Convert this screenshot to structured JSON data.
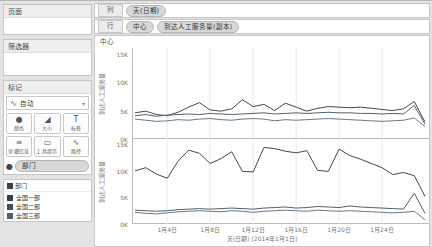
{
  "sidebar": {
    "pages": {
      "title": "页面"
    },
    "filters": {
      "title": "筛选器"
    },
    "marks": {
      "title": "标记",
      "type_icon": "∿",
      "type_label": "自动",
      "buttons": [
        {
          "name": "color",
          "icon": "●",
          "label": "颜色"
        },
        {
          "name": "size",
          "icon": "◢",
          "label": "大小"
        },
        {
          "name": "label",
          "icon": "T",
          "label": "标签"
        },
        {
          "name": "detail",
          "icon": "≡",
          "label": "详细信息"
        },
        {
          "name": "tooltip",
          "icon": "▭",
          "label": "工具提示"
        },
        {
          "name": "path",
          "icon": "∿",
          "label": "路径"
        }
      ],
      "color_shelf": {
        "icon": "●",
        "pill": "部门"
      }
    },
    "legend": {
      "title": "部门",
      "items": [
        {
          "label": "全国一部",
          "color": "#33404d"
        },
        {
          "label": "全国二部",
          "color": "#41505d"
        },
        {
          "label": "全国三部",
          "color": "#51606d"
        }
      ]
    }
  },
  "shelves": {
    "columns": {
      "label": "列",
      "pills": [
        "天(日期)"
      ]
    },
    "rows": {
      "label": "行",
      "pills": [
        "中心",
        "到达人工服务量(副本)"
      ]
    }
  },
  "chart_data": {
    "type": "line",
    "sheet_header": "中心",
    "x_caption": "天(日期) [2014年1月1日]",
    "days": 28,
    "x_ticks": [
      {
        "day": 4,
        "label": "1月4日"
      },
      {
        "day": 8,
        "label": "1月8日"
      },
      {
        "day": 12,
        "label": "1月12日"
      },
      {
        "day": 16,
        "label": "1月16日"
      },
      {
        "day": 20,
        "label": "1月20日"
      },
      {
        "day": 24,
        "label": "1月24日"
      }
    ],
    "ylim": [
      0,
      16
    ],
    "y_ticks": [
      {
        "v": 0,
        "label": "0K"
      },
      {
        "v": 5,
        "label": "5K"
      },
      {
        "v": 10,
        "label": "10K"
      },
      {
        "v": 15,
        "label": "15K"
      }
    ],
    "panels": [
      {
        "axis_title": "到达人工服务量",
        "series": [
          {
            "name": "全国一部",
            "color": "#3d4a58",
            "values": [
              4.6,
              4.9,
              4.3,
              4.1,
              4.7,
              5.6,
              6.4,
              5.1,
              4.9,
              5.3,
              6.9,
              5.7,
              6.1,
              5.0,
              6.3,
              5.6,
              4.9,
              5.4,
              5.7,
              5.6,
              5.5,
              5.6,
              5.4,
              5.2,
              5.0,
              5.3,
              6.6,
              3.0
            ]
          },
          {
            "name": "全国二部",
            "color": "#52606d",
            "values": [
              4.1,
              4.3,
              4.0,
              4.2,
              4.3,
              4.4,
              4.3,
              4.5,
              4.4,
              4.3,
              4.4,
              4.5,
              4.6,
              4.4,
              4.5,
              4.6,
              4.5,
              4.6,
              4.7,
              4.6,
              4.6,
              4.5,
              4.5,
              4.4,
              4.5,
              4.4,
              5.9,
              2.6
            ]
          },
          {
            "name": "全国三部",
            "color": "#6a7885",
            "values": [
              3.5,
              3.3,
              3.1,
              3.2,
              3.4,
              3.3,
              3.5,
              3.6,
              3.4,
              3.3,
              3.5,
              3.6,
              3.5,
              3.2,
              3.4,
              3.3,
              3.4,
              3.5,
              3.6,
              3.5,
              3.4,
              3.3,
              3.2,
              3.1,
              3.2,
              3.3,
              3.7,
              2.2
            ]
          }
        ]
      },
      {
        "axis_title": "到达人工服务量",
        "series": [
          {
            "name": "全国一部",
            "color": "#3d4a58",
            "values": [
              10.0,
              10.6,
              9.4,
              8.6,
              11.8,
              13.9,
              13.3,
              11.4,
              12.3,
              13.6,
              9.9,
              9.8,
              14.4,
              14.2,
              13.7,
              13.4,
              13.8,
              10.1,
              9.9,
              14.1,
              12.9,
              12.2,
              11.4,
              10.6,
              9.3,
              9.7,
              9.1,
              5.2
            ]
          },
          {
            "name": "全国二部",
            "color": "#52606d",
            "values": [
              2.6,
              2.5,
              2.4,
              2.5,
              2.7,
              2.8,
              2.9,
              2.8,
              2.9,
              3.0,
              2.9,
              2.8,
              3.0,
              3.1,
              3.2,
              3.0,
              3.1,
              3.3,
              3.2,
              3.1,
              3.4,
              3.2,
              3.1,
              3.0,
              2.9,
              2.8,
              5.8,
              2.0
            ]
          },
          {
            "name": "全国三部",
            "color": "#6a7885",
            "values": [
              2.2,
              2.0,
              1.9,
              2.1,
              2.3,
              2.4,
              2.5,
              2.4,
              2.3,
              2.5,
              2.4,
              2.2,
              2.4,
              2.5,
              2.6,
              2.5,
              2.4,
              2.6,
              2.5,
              2.4,
              2.5,
              2.4,
              2.3,
              2.2,
              2.1,
              2.2,
              2.4,
              0.8
            ]
          }
        ]
      }
    ],
    "grid": "vertical-only",
    "legend_position": "left-sidebar"
  }
}
